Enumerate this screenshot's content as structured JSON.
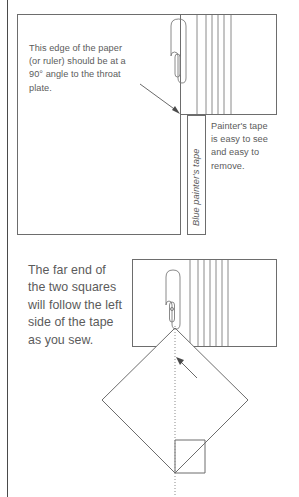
{
  "figure": {
    "type": "instructional-diagram"
  },
  "panel_top": {
    "callout_paper": "This edge of the paper\n(or ruler) should be at a\n90° angle to the throat\nplate.",
    "tape_label": "Blue painter's tape",
    "callout_tape": "Painter's tape\nis easy to see\nand easy to\nremove."
  },
  "panel_bottom": {
    "callout_squares": "    The far end of\nthe two squares\nwill follow the left\nside of the tape\nas you sew.",
    "callout_stitching": "Line of\nstitching"
  },
  "colors": {
    "stroke": "#6d6d6d",
    "text": "#5b5b5b",
    "page_edge": "#4a4a4a",
    "background": "#ffffff"
  }
}
